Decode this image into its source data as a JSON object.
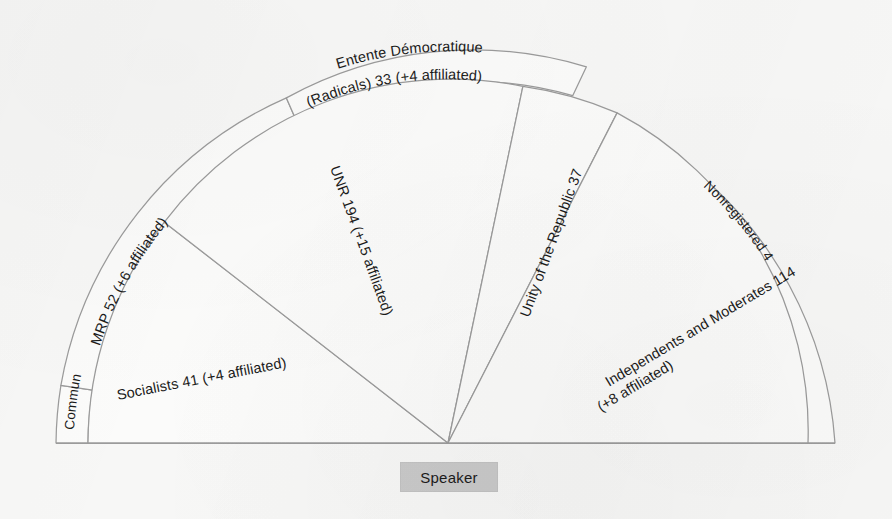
{
  "diagram": {
    "type": "hemicycle-seating-chart",
    "title_visible": false,
    "speaker": {
      "label": "Speaker"
    },
    "colors": {
      "background": "#f7f7f6",
      "sector_fill": "#fbfbfa",
      "sector_stroke": "#9b9b9b",
      "speaker_fill": "#c9c9c9",
      "text": "#1b1b1b"
    },
    "geometry": {
      "center_x": 448,
      "center_y": 443,
      "outer_radius": 392,
      "inner_band_radius": 360,
      "note": "semicircle opening upward, apex at speaker"
    },
    "groups": [
      {
        "id": "communists",
        "name": "Communists",
        "seats": 10,
        "affiliated": 0,
        "label": "Communists 10",
        "ring": "outer-band",
        "start_angle": 180,
        "end_angle": 172.5
      },
      {
        "id": "socialists",
        "name": "Socialists",
        "seats": 41,
        "affiliated": 4,
        "label": "Socialists 41 (+4 affiliated)",
        "ring": "wedge",
        "start_angle": 180,
        "end_angle": 142
      },
      {
        "id": "mrp",
        "name": "MRP",
        "seats": 52,
        "affiliated": 6,
        "label": "MRP 52 (+6 affiliated)",
        "ring": "outer-band",
        "start_angle": 172.5,
        "end_angle": 127
      },
      {
        "id": "entente-democratique",
        "name": "Entente Démocratique (Radicals)",
        "seats": 33,
        "affiliated": 4,
        "label_line1": "Entente Démocratique",
        "label_line2": "(Radicals) 33 (+4 affiliated)",
        "ring": "outer-band",
        "start_angle": 127,
        "end_angle": 86
      },
      {
        "id": "unr",
        "name": "UNR",
        "seats": 194,
        "affiliated": 15,
        "label": "UNR 194 (+15 affiliated)",
        "ring": "wedge",
        "start_angle": 142,
        "end_angle": 78
      },
      {
        "id": "unity-of-the-republic",
        "name": "Unity of the Republic",
        "seats": 37,
        "affiliated": 0,
        "label": "Unity of the Republic 37",
        "ring": "wedge",
        "start_angle": 78,
        "end_angle": 62
      },
      {
        "id": "independents-and-moderates",
        "name": "Independents and Moderates",
        "seats": 114,
        "affiliated": 8,
        "label_line1": "Independents and Moderates 114",
        "label_line2": "(+8 affiliated)",
        "ring": "wedge",
        "start_angle": 62,
        "end_angle": 0
      },
      {
        "id": "nonregistered",
        "name": "Nonregistered",
        "seats": 4,
        "affiliated": 0,
        "label": "Nonregistered 4",
        "ring": "outer-band",
        "start_angle": 48,
        "end_angle": 0
      }
    ]
  }
}
